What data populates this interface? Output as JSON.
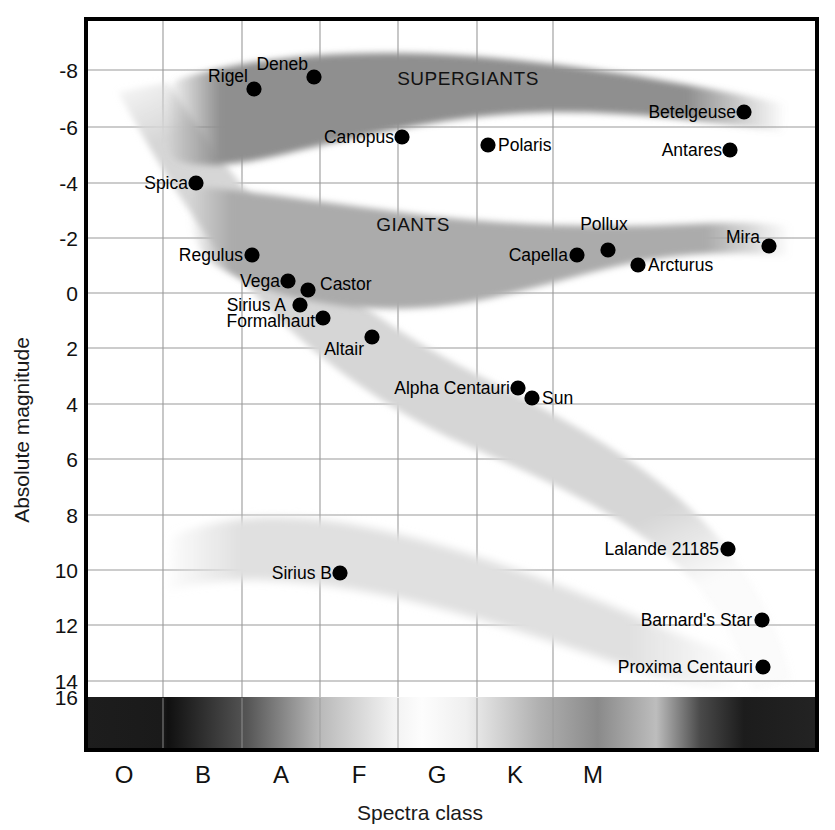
{
  "chart_data": {
    "type": "scatter",
    "title": "",
    "xlabel": "Spectra class",
    "ylabel": "Absolute magnitude",
    "xtick_labels": [
      "O",
      "B",
      "A",
      "F",
      "G",
      "K",
      "M"
    ],
    "ytick_labels": [
      "-8",
      "-6",
      "-4",
      "-2",
      "0",
      "2",
      "4",
      "6",
      "8",
      "10",
      "12",
      "14",
      "16"
    ],
    "ylim": [
      -9.3,
      16.9
    ],
    "xlim": [
      0,
      7
    ],
    "y_inverted": true,
    "grid": true,
    "legend": "none",
    "annotations": [
      "SUPERGIANTS",
      "GIANTS"
    ],
    "regions": [
      {
        "name": "SUPERGIANTS",
        "label_x": 468,
        "label_y": 85,
        "shade": "#8c8c8c"
      },
      {
        "name": "GIANTS",
        "label_x": 413,
        "label_y": 231,
        "shade": "#a8a8a8"
      },
      {
        "name": "main-sequence",
        "label": "",
        "shade": "#d4d4d4"
      },
      {
        "name": "white-dwarfs",
        "label": "",
        "shade": "#dedede"
      }
    ],
    "points": [
      {
        "name": "Deneb",
        "x": 314,
        "y": 77,
        "label_x": 308,
        "label_y": 70,
        "anchor": "end",
        "spectra": "A",
        "magnitude": -8.2
      },
      {
        "name": "Rigel",
        "x": 254,
        "y": 89,
        "label_x": 248,
        "label_y": 82,
        "anchor": "end",
        "spectra": "B",
        "magnitude": -7.0
      },
      {
        "name": "Betelgeuse",
        "x": 744,
        "y": 112,
        "label_x": 736,
        "label_y": 118,
        "anchor": "end",
        "spectra": "M",
        "magnitude": -5.6
      },
      {
        "name": "Canopus",
        "x": 402,
        "y": 137,
        "label_x": 394,
        "label_y": 143,
        "anchor": "end",
        "spectra": "F",
        "magnitude": -5.3
      },
      {
        "name": "Polaris",
        "x": 488,
        "y": 145,
        "label_x": 498,
        "label_y": 151,
        "anchor": "start",
        "spectra": "F",
        "magnitude": -5.0
      },
      {
        "name": "Antares",
        "x": 730,
        "y": 150,
        "label_x": 722,
        "label_y": 156,
        "anchor": "end",
        "spectra": "M",
        "magnitude": -5.0
      },
      {
        "name": "Spica",
        "x": 196,
        "y": 183,
        "label_x": 188,
        "label_y": 189,
        "anchor": "end",
        "spectra": "B",
        "magnitude": -3.6
      },
      {
        "name": "Mira",
        "x": 769,
        "y": 246,
        "label_x": 760,
        "label_y": 243,
        "anchor": "end",
        "spectra": "M",
        "magnitude": -1.2
      },
      {
        "name": "Pollux",
        "x": 608,
        "y": 250,
        "label_x": 604,
        "label_y": 230,
        "anchor": "middle",
        "spectra": "K",
        "magnitude": -1.0
      },
      {
        "name": "Capella",
        "x": 577,
        "y": 255,
        "label_x": 568,
        "label_y": 261,
        "anchor": "end",
        "spectra": "G",
        "magnitude": -0.9
      },
      {
        "name": "Regulus",
        "x": 252,
        "y": 255,
        "label_x": 243,
        "label_y": 261,
        "anchor": "end",
        "spectra": "B",
        "magnitude": -0.9
      },
      {
        "name": "Arcturus",
        "x": 638,
        "y": 265,
        "label_x": 648,
        "label_y": 271,
        "anchor": "start",
        "spectra": "K",
        "magnitude": -0.5
      },
      {
        "name": "Vega",
        "x": 288,
        "y": 281,
        "label_x": 280,
        "label_y": 287,
        "anchor": "end",
        "spectra": "A",
        "magnitude": 0.0
      },
      {
        "name": "Castor",
        "x": 308,
        "y": 290,
        "label_x": 320,
        "label_y": 290,
        "anchor": "start",
        "spectra": "A",
        "magnitude": 0.4
      },
      {
        "name": "Sirius A",
        "x": 300,
        "y": 305,
        "label_x": 286,
        "label_y": 311,
        "anchor": "end",
        "spectra": "A",
        "magnitude": 0.9
      },
      {
        "name": "Formalhaut",
        "x": 323,
        "y": 318,
        "label_x": 315,
        "label_y": 327,
        "anchor": "end",
        "spectra": "A",
        "magnitude": 1.5
      },
      {
        "name": "Altair",
        "x": 372,
        "y": 337,
        "label_x": 364,
        "label_y": 355,
        "anchor": "end",
        "spectra": "A",
        "magnitude": 2.2
      },
      {
        "name": "Alpha Centauri",
        "x": 518,
        "y": 388,
        "label_x": 510,
        "label_y": 394,
        "anchor": "end",
        "spectra": "G",
        "magnitude": 4.3
      },
      {
        "name": "Sun",
        "x": 532,
        "y": 398,
        "label_x": 542,
        "label_y": 404,
        "anchor": "start",
        "spectra": "G",
        "magnitude": 4.6
      },
      {
        "name": "Lalande 21185",
        "x": 728,
        "y": 549,
        "label_x": 719,
        "label_y": 555,
        "anchor": "end",
        "spectra": "M",
        "magnitude": 10.4
      },
      {
        "name": "Sirius B",
        "x": 340,
        "y": 573,
        "label_x": 332,
        "label_y": 579,
        "anchor": "end",
        "spectra": "A",
        "magnitude": 11.3
      },
      {
        "name": "Barnard's Star",
        "x": 762,
        "y": 620,
        "label_x": 752,
        "label_y": 626,
        "anchor": "end",
        "spectra": "M",
        "magnitude": 13.2
      },
      {
        "name": "Proxima Centauri",
        "x": 763,
        "y": 667,
        "label_x": 753,
        "label_y": 673,
        "anchor": "end",
        "spectra": "M",
        "magnitude": 15.1
      }
    ]
  },
  "axes": {
    "y_title": "Absolute magnitude",
    "x_title": "Spectra class",
    "y_ticks": [
      {
        "label": "-8",
        "y": 70
      },
      {
        "label": "-6",
        "y": 127
      },
      {
        "label": "-4",
        "y": 183
      },
      {
        "label": "-2",
        "y": 238
      },
      {
        "label": "0",
        "y": 293
      },
      {
        "label": "2",
        "y": 348
      },
      {
        "label": "4",
        "y": 404
      },
      {
        "label": "6",
        "y": 459
      },
      {
        "label": "8",
        "y": 515
      },
      {
        "label": "10",
        "y": 570
      },
      {
        "label": "12",
        "y": 625
      },
      {
        "label": "14",
        "y": 681
      },
      {
        "label": "16",
        "y": 697
      }
    ],
    "x_ticks": [
      {
        "label": "O",
        "x": 124
      },
      {
        "label": "B",
        "x": 203
      },
      {
        "label": "A",
        "x": 281
      },
      {
        "label": "F",
        "x": 359
      },
      {
        "label": "G",
        "x": 437
      },
      {
        "label": "K",
        "x": 515
      },
      {
        "label": "M",
        "x": 593
      }
    ],
    "gridlines_x": [
      163,
      242,
      320,
      398,
      477,
      553
    ],
    "plot_left": 85,
    "plot_right": 818,
    "plot_top": 18,
    "plot_bottom": 750,
    "spectra_band_top": 697,
    "spectra_band_bottom": 750
  },
  "colors": {
    "supergiants": "#8f8f8f",
    "giants": "#ababab",
    "main_sequence": "#d6d6d6",
    "white_dwarfs": "#e0e0e0",
    "grid": "#9a9a9a",
    "border": "#000000",
    "point": "#000000",
    "text": "#111111"
  }
}
